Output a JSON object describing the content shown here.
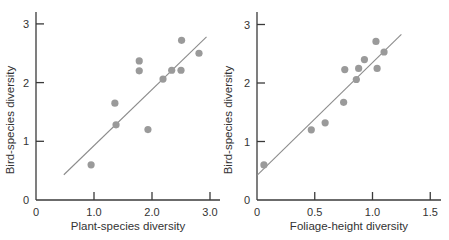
{
  "chart_data": [
    {
      "type": "scatter",
      "title": "",
      "xlabel": "Plant-species diversity",
      "ylabel": "Bird-species diversity",
      "xlim": [
        0,
        3.2
      ],
      "ylim": [
        0,
        3.2
      ],
      "xticks": [
        0,
        1.0,
        2.0,
        3.0
      ],
      "xtick_labels": [
        "0",
        "1.0",
        "2.0",
        "3.0"
      ],
      "yticks": [
        0,
        1,
        2,
        3
      ],
      "ytick_labels": [
        "0",
        "1",
        "2",
        "3"
      ],
      "grid": false,
      "legend": null,
      "points": [
        {
          "x": 0.95,
          "y": 0.6
        },
        {
          "x": 1.36,
          "y": 1.65
        },
        {
          "x": 1.38,
          "y": 1.28
        },
        {
          "x": 1.78,
          "y": 2.37
        },
        {
          "x": 1.78,
          "y": 2.2
        },
        {
          "x": 1.93,
          "y": 1.2
        },
        {
          "x": 2.19,
          "y": 2.06
        },
        {
          "x": 2.34,
          "y": 2.21
        },
        {
          "x": 2.5,
          "y": 2.21
        },
        {
          "x": 2.51,
          "y": 2.72
        },
        {
          "x": 2.81,
          "y": 2.5
        }
      ],
      "regression_line": {
        "x1": 0.48,
        "y1": 0.43,
        "x2": 2.94,
        "y2": 2.78
      }
    },
    {
      "type": "scatter",
      "title": "",
      "xlabel": "Foliage-height diversity",
      "ylabel": "Bird-species diversity",
      "xlim": [
        0,
        1.6
      ],
      "ylim": [
        0,
        3.2
      ],
      "xticks": [
        0,
        0.5,
        1.0,
        1.5
      ],
      "xtick_labels": [
        "0",
        "0.5",
        "1.0",
        "1.5"
      ],
      "yticks": [
        0,
        1,
        2,
        3
      ],
      "ytick_labels": [
        "0",
        "1",
        "2",
        "3"
      ],
      "grid": false,
      "legend": null,
      "points": [
        {
          "x": 0.06,
          "y": 0.6
        },
        {
          "x": 0.47,
          "y": 1.2
        },
        {
          "x": 0.59,
          "y": 1.32
        },
        {
          "x": 0.75,
          "y": 1.67
        },
        {
          "x": 0.76,
          "y": 2.23
        },
        {
          "x": 0.86,
          "y": 2.06
        },
        {
          "x": 0.88,
          "y": 2.25
        },
        {
          "x": 0.93,
          "y": 2.4
        },
        {
          "x": 1.03,
          "y": 2.71
        },
        {
          "x": 1.04,
          "y": 2.25
        },
        {
          "x": 1.1,
          "y": 2.53
        }
      ],
      "regression_line": {
        "x1": 0.0,
        "y1": 0.42,
        "x2": 1.25,
        "y2": 2.83
      }
    }
  ]
}
